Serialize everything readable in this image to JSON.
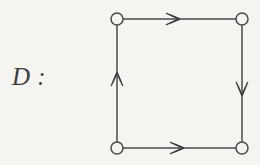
{
  "figure": {
    "label": "D :",
    "background_color": "#f5f4f1",
    "stroke_color": "#4a4a4a",
    "label_color": "#3c3c3c"
  },
  "graph": {
    "node_radius": 6,
    "nodes": [
      {
        "id": "top-left",
        "cx": 117,
        "cy": 19,
        "label": ""
      },
      {
        "id": "top-right",
        "cx": 242,
        "cy": 19,
        "label": ""
      },
      {
        "id": "bottom-left",
        "cx": 117,
        "cy": 148,
        "label": ""
      },
      {
        "id": "bottom-right",
        "cx": 242,
        "cy": 148,
        "label": ""
      }
    ],
    "edges": [
      {
        "id": "top-edge",
        "from": "top-left",
        "to": "top-right",
        "direction": "right",
        "label": ""
      },
      {
        "id": "right-edge",
        "from": "top-right",
        "to": "bottom-right",
        "direction": "down",
        "label": ""
      },
      {
        "id": "bottom-edge",
        "from": "bottom-left",
        "to": "bottom-right",
        "direction": "right",
        "label": ""
      },
      {
        "id": "left-edge",
        "from": "bottom-left",
        "to": "top-left",
        "direction": "up",
        "label": ""
      }
    ]
  }
}
